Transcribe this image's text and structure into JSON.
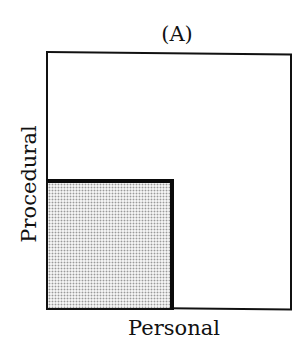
{
  "diagram": {
    "panel_label": "(A)",
    "x_axis_label": "Personal",
    "y_axis_label": "Procedural",
    "regions": [
      {
        "name": "outer-square",
        "fill": "#ffffff",
        "border": "#111111"
      },
      {
        "name": "shaded-subsquare",
        "fill_pattern": "stipple",
        "fill": "#f2f2f2",
        "dot_color": "#9a9a9a",
        "border": "#0a0a0a",
        "position": "bottom-left"
      }
    ]
  }
}
